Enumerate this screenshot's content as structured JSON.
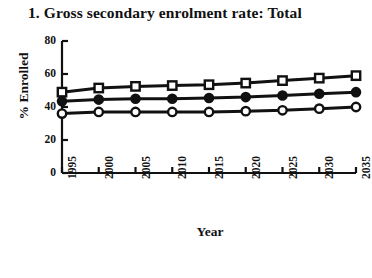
{
  "chart_data": {
    "type": "line",
    "title": "1. Gross secondary enrolment rate: Total",
    "xlabel": "Year",
    "ylabel": "% Enrolled",
    "x": [
      1995,
      2000,
      2005,
      2010,
      2015,
      2020,
      2025,
      2030,
      2035
    ],
    "xtick_labels": [
      "1995",
      "2000",
      "2005",
      "2010",
      "2015",
      "2020",
      "2025",
      "2030",
      "2035"
    ],
    "ytick_labels": [
      "0",
      "20",
      "40",
      "60",
      "80"
    ],
    "yticks": [
      0,
      20,
      40,
      60,
      80
    ],
    "ylim": [
      0,
      80
    ],
    "xlim": [
      1995,
      2035
    ],
    "grid": false,
    "legend": "none",
    "series": [
      {
        "name": "series-open-square",
        "marker": "open-square",
        "values": [
          49,
          51.5,
          52.5,
          53,
          53.5,
          54.5,
          56,
          57.5,
          59
        ]
      },
      {
        "name": "series-filled-circle",
        "marker": "filled-circle",
        "values": [
          43.5,
          44.5,
          45,
          45,
          45.5,
          46,
          47,
          48,
          49
        ]
      },
      {
        "name": "series-open-circle",
        "marker": "open-circle",
        "values": [
          36,
          37,
          37,
          37,
          37,
          37.5,
          38,
          39,
          40
        ]
      }
    ]
  },
  "colors": {
    "ink": "#111111",
    "background": "#ffffff"
  }
}
